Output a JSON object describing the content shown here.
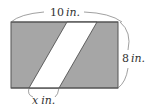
{
  "diagram": {
    "rect": {
      "x": 11,
      "y": 22,
      "width": 107,
      "height": 66,
      "fill": "#a6a6a6",
      "stroke": "#555555"
    },
    "stripe": {
      "fill": "#ffffff",
      "top_left_x": 67,
      "top_right_x": 97,
      "bottom_left_x": 29,
      "bottom_right_x": 59
    },
    "labels": {
      "width": {
        "value": "10",
        "unit": "in."
      },
      "height": {
        "value": "8",
        "unit": "in."
      },
      "base": {
        "value": "x",
        "unit": "in."
      }
    }
  }
}
